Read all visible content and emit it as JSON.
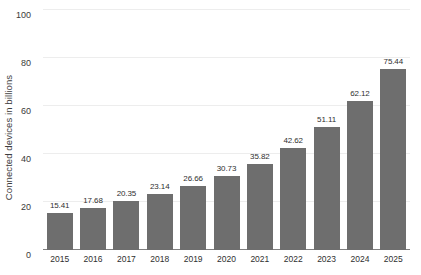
{
  "chart_data": {
    "type": "bar",
    "title": "",
    "subtitle": "",
    "xlabel": "",
    "ylabel": "Connected devices in billions",
    "categories": [
      "2015",
      "2016",
      "2017",
      "2018",
      "2019",
      "2020",
      "2021",
      "2022",
      "2023",
      "2024",
      "2025"
    ],
    "values": [
      15.41,
      17.68,
      20.35,
      23.14,
      26.66,
      30.73,
      35.82,
      42.62,
      51.11,
      62.12,
      75.44
    ],
    "value_labels": [
      "15.41",
      "17.68",
      "20.35",
      "23.14",
      "26.66",
      "30.73",
      "35.82",
      "42.62",
      "51.11",
      "62.12",
      "75.44"
    ],
    "ylim": [
      0,
      100
    ],
    "yticks": [
      0,
      20,
      40,
      60,
      80,
      100
    ],
    "ytick_labels": [
      "0",
      "20",
      "40",
      "60",
      "80",
      "100"
    ],
    "grid": true,
    "legend": false,
    "legend_position": "none",
    "bar_color": "#6e6e6e",
    "gridline_color": "#ededed",
    "axis_line_color": "#808080",
    "background_color": "#ffffff",
    "text_color": "#2f2f2f"
  }
}
